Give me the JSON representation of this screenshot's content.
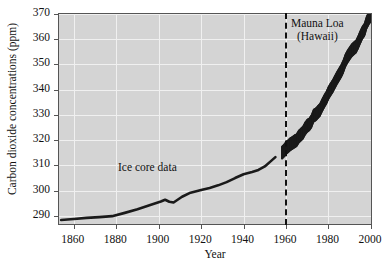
{
  "chart_data": {
    "type": "line",
    "title": "",
    "xlabel": "Year",
    "ylabel": "Carbon dioxide concentrations (ppm)",
    "xlim": [
      1853,
      2001
    ],
    "ylim": [
      286,
      370
    ],
    "xticks": [
      1860,
      1880,
      1900,
      1920,
      1940,
      1960,
      1980,
      2000
    ],
    "xticklabels": [
      "1860",
      "1880",
      "1900",
      "1920",
      "1940",
      "1960",
      "1980",
      "2000"
    ],
    "yticks": [
      290,
      300,
      310,
      320,
      330,
      340,
      350,
      360,
      370
    ],
    "yticklabels": [
      "290",
      "300",
      "310",
      "320",
      "330",
      "340",
      "350",
      "360",
      "370"
    ],
    "grid": true,
    "grid_color": "#f0f0f0",
    "plot_background": "#d4d4d4",
    "legend_position": "inline-annotation",
    "annotations": [
      {
        "text": "Ice core data",
        "x": 1895,
        "y": 308
      },
      {
        "text": "Mauna Loa",
        "x": 1972,
        "y": 365
      },
      {
        "text": "(Hawaii)",
        "x": 1972,
        "y": 361
      }
    ],
    "vertical_divider": {
      "x": 1958,
      "style": "dashed",
      "color": "#111111"
    },
    "series": [
      {
        "name": "Ice core data",
        "style": "solid-thick-line",
        "color": "#1a1a1a",
        "x": [
          1854,
          1860,
          1866,
          1872,
          1878,
          1884,
          1890,
          1896,
          1901,
          1903,
          1905,
          1907,
          1911,
          1915,
          1920,
          1924,
          1928,
          1932,
          1936,
          1940,
          1944,
          1947,
          1950,
          1953,
          1955
        ],
        "y": [
          288.4,
          288.8,
          289.2,
          289.5,
          289.9,
          291.2,
          292.6,
          294.3,
          295.7,
          296.4,
          295.6,
          295.3,
          297.6,
          299.2,
          300.3,
          301.1,
          302.1,
          303.4,
          305.0,
          306.5,
          307.4,
          308.2,
          309.6,
          311.8,
          313.3
        ]
      },
      {
        "name": "Mauna Loa (Hawaii)",
        "style": "sawtooth-seasonal-oscillation",
        "color": "#1a1a1a",
        "seasonal_amplitude_ppm": 6.0,
        "x": [
          1958,
          1959,
          1960,
          1961,
          1962,
          1963,
          1964,
          1965,
          1966,
          1967,
          1968,
          1969,
          1970,
          1971,
          1972,
          1973,
          1974,
          1975,
          1976,
          1977,
          1978,
          1979,
          1980,
          1981,
          1982,
          1983,
          1984,
          1985,
          1986,
          1987,
          1988,
          1989,
          1990,
          1991,
          1992,
          1993,
          1994,
          1995,
          1996,
          1997,
          1998,
          1999,
          2000
        ],
        "y": [
          315.0,
          315.8,
          316.9,
          317.6,
          318.4,
          318.9,
          319.5,
          320.0,
          321.4,
          322.2,
          323.0,
          324.6,
          325.7,
          326.3,
          327.5,
          329.7,
          330.2,
          331.1,
          332.0,
          333.8,
          335.4,
          336.8,
          338.7,
          340.1,
          341.4,
          343.0,
          344.6,
          346.0,
          347.4,
          349.2,
          351.6,
          353.1,
          354.4,
          355.6,
          356.4,
          357.1,
          358.8,
          360.8,
          362.6,
          363.8,
          366.6,
          368.3,
          369.5
        ]
      }
    ]
  }
}
